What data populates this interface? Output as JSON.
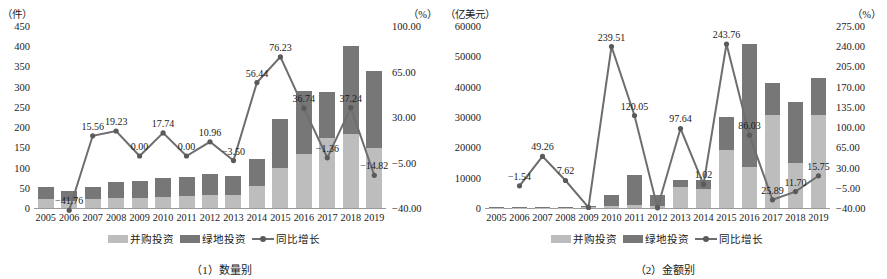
{
  "figure": {
    "panels": [
      {
        "caption": "（1）数量别",
        "left_axis_unit": "（件）",
        "right_axis_unit": "（%）",
        "legend": [
          {
            "key": "merger",
            "label": "并购投资",
            "color": "#bdbdbd"
          },
          {
            "key": "greenfield",
            "label": "绿地投资",
            "color": "#777777"
          },
          {
            "key": "growth",
            "label": "同比增长",
            "color": "#6e6e6e"
          }
        ],
        "chart_data": {
          "type": "bar",
          "title": "（1）数量别",
          "xlabel": "",
          "ylabel": "（件）",
          "y2label": "（%）",
          "ylim": [
            0,
            450
          ],
          "y2lim": [
            -40,
            100
          ],
          "yticks": [
            "0",
            "50",
            "100",
            "150",
            "200",
            "250",
            "300",
            "350",
            "400",
            "450"
          ],
          "y2ticks": [
            "-40.00",
            "-5.00",
            "30.00",
            "65.00",
            "100.00"
          ],
          "grid": false,
          "legend_position": "bottom",
          "categories": [
            "2005",
            "2006",
            "2007",
            "2008",
            "2009",
            "2010",
            "2011",
            "2012",
            "2013",
            "2014",
            "2015",
            "2016",
            "2017",
            "2018",
            "2019"
          ],
          "series": [
            {
              "name": "并购投资",
              "type": "bar-stack",
              "axis": "left",
              "values": [
                22,
                18,
                22,
                24,
                25,
                28,
                30,
                33,
                32,
                55,
                100,
                133,
                172,
                182,
                148
              ]
            },
            {
              "name": "绿地投资",
              "type": "bar-stack",
              "axis": "left",
              "values": [
                29,
                25,
                29,
                41,
                42,
                47,
                46,
                50,
                48,
                67,
                120,
                156,
                116,
                218,
                190
              ]
            },
            {
              "name": "同比增长",
              "type": "line",
              "axis": "right",
              "values": [
                null,
                -41.76,
                15.56,
                19.23,
                0.0,
                17.74,
                0.0,
                10.96,
                -3.5,
                56.44,
                76.23,
                36.74,
                -1.36,
                37.24,
                -14.82
              ]
            }
          ],
          "data_labels": [
            {
              "category": "2006",
              "value": "-41.76"
            },
            {
              "category": "2007",
              "value": "15.56"
            },
            {
              "category": "2008",
              "value": "19.23"
            },
            {
              "category": "2009",
              "value": "0.00"
            },
            {
              "category": "2010",
              "value": "17.74"
            },
            {
              "category": "2011",
              "value": "0.00"
            },
            {
              "category": "2012",
              "value": "10.96"
            },
            {
              "category": "2013",
              "value": "-3.50"
            },
            {
              "category": "2014",
              "value": "56.44"
            },
            {
              "category": "2015",
              "value": "76.23"
            },
            {
              "category": "2016",
              "value": "36.74"
            },
            {
              "category": "2017",
              "value": "-1.36"
            },
            {
              "category": "2018",
              "value": "37.24"
            },
            {
              "category": "2019",
              "value": "-14.82"
            }
          ]
        }
      },
      {
        "caption": "（2）金额别",
        "left_axis_unit": "（亿美元）",
        "right_axis_unit": "（%）",
        "legend": [
          {
            "key": "merger",
            "label": "并购投资",
            "color": "#bdbdbd"
          },
          {
            "key": "greenfield",
            "label": "绿地投资",
            "color": "#777777"
          },
          {
            "key": "growth",
            "label": "同比增长",
            "color": "#6e6e6e"
          }
        ],
        "chart_data": {
          "type": "bar",
          "title": "（2）金额别",
          "xlabel": "",
          "ylabel": "（亿美元）",
          "y2label": "（%）",
          "ylim": [
            0,
            60000
          ],
          "y2lim": [
            -40,
            275
          ],
          "yticks": [
            "0",
            "10000",
            "20000",
            "30000",
            "40000",
            "50000",
            "60000"
          ],
          "y2ticks": [
            "-40.00",
            "-5.00",
            "30.00",
            "65.00",
            "100.00",
            "135.00",
            "170.00",
            "205.00",
            "240.00",
            "275.00"
          ],
          "grid": false,
          "legend_position": "bottom",
          "categories": [
            "2005",
            "2006",
            "2007",
            "2008",
            "2009",
            "2010",
            "2011",
            "2012",
            "2013",
            "2014",
            "2015",
            "2016",
            "2017",
            "2018",
            "2019"
          ],
          "series": [
            {
              "name": "并购投资",
              "type": "bar-stack",
              "axis": "left",
              "values": [
                120,
                110,
                140,
                130,
                380,
                600,
                1000,
                500,
                6800,
                6300,
                19200,
                13500,
                30500,
                15000,
                30500
              ]
            },
            {
              "name": "绿地投资",
              "type": "bar-stack",
              "axis": "left",
              "values": [
                200,
                190,
                350,
                260,
                300,
                3800,
                9800,
                3900,
                2400,
                3000,
                10800,
                40500,
                10700,
                19800,
                12500
              ]
            },
            {
              "name": "同比增长",
              "type": "line",
              "axis": "right",
              "values": [
                null,
                -1.54,
                49.26,
                7.62,
                -39.0,
                239.51,
                120.05,
                -39.5,
                97.64,
                1.02,
                243.76,
                86.03,
                -25.89,
                -11.7,
                15.75
              ]
            }
          ],
          "data_labels": [
            {
              "category": "2006",
              "value": "-1.54"
            },
            {
              "category": "2007",
              "value": "49.26"
            },
            {
              "category": "2008",
              "value": "7.62"
            },
            {
              "category": "2010",
              "value": "239.51"
            },
            {
              "category": "2011",
              "value": "120.05"
            },
            {
              "category": "2013",
              "value": "97.64"
            },
            {
              "category": "2014",
              "value": "1.02"
            },
            {
              "category": "2015",
              "value": "243.76"
            },
            {
              "category": "2016",
              "value": "86.03"
            },
            {
              "category": "2017",
              "value": "25.89"
            },
            {
              "category": "2018",
              "value": "11.70"
            },
            {
              "category": "2019",
              "value": "15.75"
            }
          ]
        }
      }
    ]
  }
}
